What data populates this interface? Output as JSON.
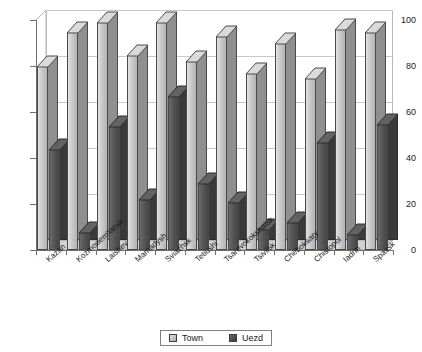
{
  "chart_data": {
    "type": "bar",
    "title": "",
    "subtitle": "",
    "xlabel": "",
    "ylabel": "",
    "ylim": [
      0,
      100
    ],
    "yticks": [
      0,
      20,
      40,
      60,
      80,
      100
    ],
    "grid": true,
    "legend_position": "bottom",
    "style": "3d-clustered-column",
    "categories": [
      "Kazan",
      "Kozmodem'iansk",
      "Laishev",
      "Mamadysh",
      "Sviazhsk",
      "Tetiushi",
      "Tsarevokokshaisk",
      "Tsivilsk",
      "Cheboksary",
      "Chistopol",
      "Iadrin",
      "Spassk"
    ],
    "series": [
      {
        "name": "Town",
        "color": "#c9c9c9",
        "values": [
          80,
          95,
          99,
          85,
          99,
          82,
          93,
          77,
          90,
          75,
          96,
          95
        ]
      },
      {
        "name": "Uezd",
        "color": "#565656",
        "values": [
          44,
          8,
          54,
          22,
          67,
          29,
          21,
          9,
          12,
          47,
          7,
          55
        ]
      }
    ]
  },
  "legend": {
    "items": [
      {
        "label": "Town",
        "swatch": "town"
      },
      {
        "label": "Uezd",
        "swatch": "uezd"
      }
    ]
  },
  "axis": {
    "y_tick_labels": [
      "0",
      "20",
      "40",
      "60",
      "80",
      "100"
    ]
  }
}
